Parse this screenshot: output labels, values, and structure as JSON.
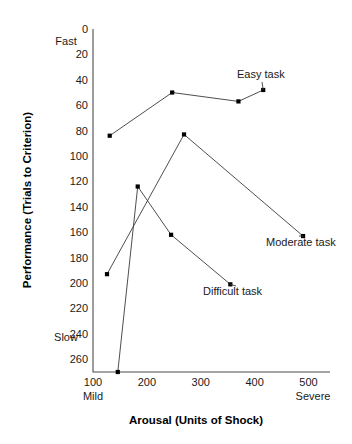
{
  "chart_data": {
    "type": "line",
    "title": "",
    "xlabel": "Arousal (Units of Shock)",
    "ylabel": "Performance (Trials to Criterion)",
    "xlim": [
      100,
      540
    ],
    "ylim": [
      0,
      270
    ],
    "y_inverted": true,
    "grid": false,
    "legend_position": "inline-annotations",
    "x_ticks": [
      100,
      200,
      300,
      400,
      500
    ],
    "x_tick_labels": [
      "100",
      "200",
      "300",
      "400",
      "500"
    ],
    "y_ticks": [
      0,
      20,
      40,
      60,
      80,
      100,
      120,
      140,
      160,
      180,
      200,
      220,
      240,
      260
    ],
    "y_tick_labels": [
      "0",
      "20",
      "40",
      "60",
      "80",
      "100",
      "120",
      "140",
      "160",
      "180",
      "200",
      "220",
      "240",
      "260"
    ],
    "x_axis_anchor_low": "Mild",
    "x_axis_anchor_high": "Severe",
    "y_axis_anchor_top": "Fast",
    "y_axis_anchor_bottom": "Slow",
    "series": [
      {
        "name": "Easy task",
        "label": "Easy task",
        "points": [
          {
            "x": 131,
            "y": 84
          },
          {
            "x": 247,
            "y": 50
          },
          {
            "x": 370,
            "y": 57
          },
          {
            "x": 416,
            "y": 48
          }
        ]
      },
      {
        "name": "Moderate task",
        "label": "Moderate task",
        "points": [
          {
            "x": 126,
            "y": 193
          },
          {
            "x": 269,
            "y": 83
          },
          {
            "x": 490,
            "y": 163
          }
        ]
      },
      {
        "name": "Difficult task",
        "label": "Difficult task",
        "points": [
          {
            "x": 146,
            "y": 270
          },
          {
            "x": 183,
            "y": 124
          },
          {
            "x": 245,
            "y": 162
          },
          {
            "x": 355,
            "y": 201
          }
        ]
      }
    ]
  },
  "labels": {
    "easy_task": "Easy task",
    "moderate_task": "Moderate task",
    "difficult_task": "Difficult task",
    "fast": "Fast",
    "slow": "Slow",
    "mild": "Mild",
    "severe": "Severe",
    "x_axis_title": "Arousal (Units of Shock)",
    "y_axis_title": "Performance (Trials to Criterion)"
  },
  "y_tick_values": {
    "t0": "0",
    "t1": "20",
    "t2": "40",
    "t3": "60",
    "t4": "80",
    "t5": "100",
    "t6": "120",
    "t7": "140",
    "t8": "160",
    "t9": "180",
    "t10": "200",
    "t11": "220",
    "t12": "240",
    "t13": "260"
  },
  "x_tick_values": {
    "t0": "100",
    "t1": "200",
    "t2": "300",
    "t3": "400",
    "t4": "500"
  },
  "colors": {
    "background": "#ffffff",
    "axis": "#4d4d4d",
    "line": "#3a3a3a",
    "point": "#000000",
    "text": "#1a1a1a"
  }
}
